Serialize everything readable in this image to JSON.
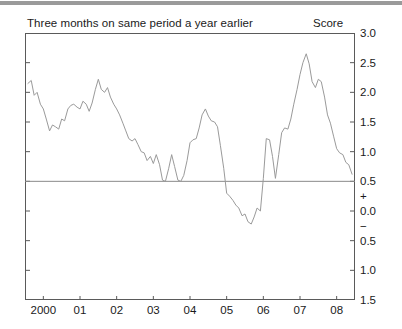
{
  "chart_data": {
    "type": "line",
    "title": "Three months on same period a year earlier",
    "subtitle": "",
    "xlabel": "",
    "ylabel": "Score",
    "ylim": [
      -1.5,
      3.0
    ],
    "xlim": [
      1999.5,
      2008.5
    ],
    "grid": false,
    "legend": null,
    "reference_line": 0.5,
    "y_ticks": [
      "3.0",
      "2.5",
      "2.0",
      "1.5",
      "1.0",
      "0.5",
      "+",
      "0.0",
      "−",
      "0.5",
      "1.0",
      "1.5"
    ],
    "y_tick_values": [
      3.0,
      2.5,
      2.0,
      1.5,
      1.0,
      0.5,
      0.25,
      0.0,
      -0.25,
      -0.5,
      -1.0,
      -1.5
    ],
    "x_ticks": [
      "2000",
      "01",
      "02",
      "03",
      "04",
      "05",
      "06",
      "07",
      "08"
    ],
    "x_tick_values": [
      2000,
      2001,
      2002,
      2003,
      2004,
      2005,
      2006,
      2007,
      2008
    ],
    "series": [
      {
        "name": "Score",
        "color": "#9a9a9a",
        "x": [
          1999.58,
          1999.67,
          1999.75,
          1999.83,
          1999.92,
          2000.0,
          2000.08,
          2000.17,
          2000.25,
          2000.33,
          2000.42,
          2000.5,
          2000.58,
          2000.67,
          2000.75,
          2000.83,
          2000.92,
          2001.0,
          2001.08,
          2001.17,
          2001.25,
          2001.33,
          2001.42,
          2001.5,
          2001.58,
          2001.67,
          2001.75,
          2001.83,
          2001.92,
          2002.0,
          2002.08,
          2002.17,
          2002.25,
          2002.33,
          2002.42,
          2002.5,
          2002.58,
          2002.67,
          2002.75,
          2002.83,
          2002.92,
          2003.0,
          2003.08,
          2003.17,
          2003.25,
          2003.33,
          2003.42,
          2003.5,
          2003.58,
          2003.67,
          2003.75,
          2003.83,
          2003.92,
          2004.0,
          2004.08,
          2004.17,
          2004.25,
          2004.33,
          2004.42,
          2004.5,
          2004.58,
          2004.67,
          2004.75,
          2004.83,
          2004.92,
          2005.0,
          2005.08,
          2005.17,
          2005.25,
          2005.33,
          2005.42,
          2005.5,
          2005.58,
          2005.67,
          2005.75,
          2005.83,
          2005.92,
          2006.0,
          2006.08,
          2006.17,
          2006.25,
          2006.33,
          2006.42,
          2006.5,
          2006.58,
          2006.67,
          2006.75,
          2006.83,
          2006.92,
          2007.0,
          2007.08,
          2007.17,
          2007.25,
          2007.33,
          2007.42,
          2007.5,
          2007.58,
          2007.67,
          2007.75,
          2007.83,
          2007.92,
          2008.0,
          2008.08,
          2008.17,
          2008.25,
          2008.33,
          2008.42
        ],
        "y": [
          2.15,
          2.2,
          1.95,
          2.0,
          1.8,
          1.72,
          1.55,
          1.35,
          1.45,
          1.42,
          1.38,
          1.55,
          1.52,
          1.72,
          1.78,
          1.8,
          1.75,
          1.72,
          1.85,
          1.8,
          1.68,
          1.82,
          2.05,
          2.22,
          2.05,
          2.0,
          2.08,
          1.92,
          1.8,
          1.72,
          1.62,
          1.48,
          1.35,
          1.22,
          1.18,
          1.22,
          1.12,
          1.0,
          0.98,
          0.85,
          0.92,
          0.8,
          0.95,
          0.78,
          0.52,
          0.5,
          0.72,
          0.95,
          0.75,
          0.52,
          0.5,
          0.6,
          0.85,
          1.15,
          1.2,
          1.22,
          1.4,
          1.62,
          1.72,
          1.6,
          1.52,
          1.5,
          1.42,
          1.1,
          0.72,
          0.3,
          0.25,
          0.18,
          0.1,
          0.05,
          -0.08,
          -0.05,
          -0.18,
          -0.22,
          -0.1,
          0.05,
          0.0,
          0.55,
          1.22,
          1.2,
          0.92,
          0.55,
          0.95,
          1.32,
          1.4,
          1.38,
          1.55,
          1.8,
          2.05,
          2.3,
          2.5,
          2.65,
          2.48,
          2.18,
          2.08,
          2.22,
          2.18,
          1.92,
          1.62,
          1.48,
          1.25,
          1.05,
          0.98,
          0.95,
          0.82,
          0.78,
          0.62
        ]
      }
    ]
  },
  "axis": {
    "score_caption": "Score"
  }
}
